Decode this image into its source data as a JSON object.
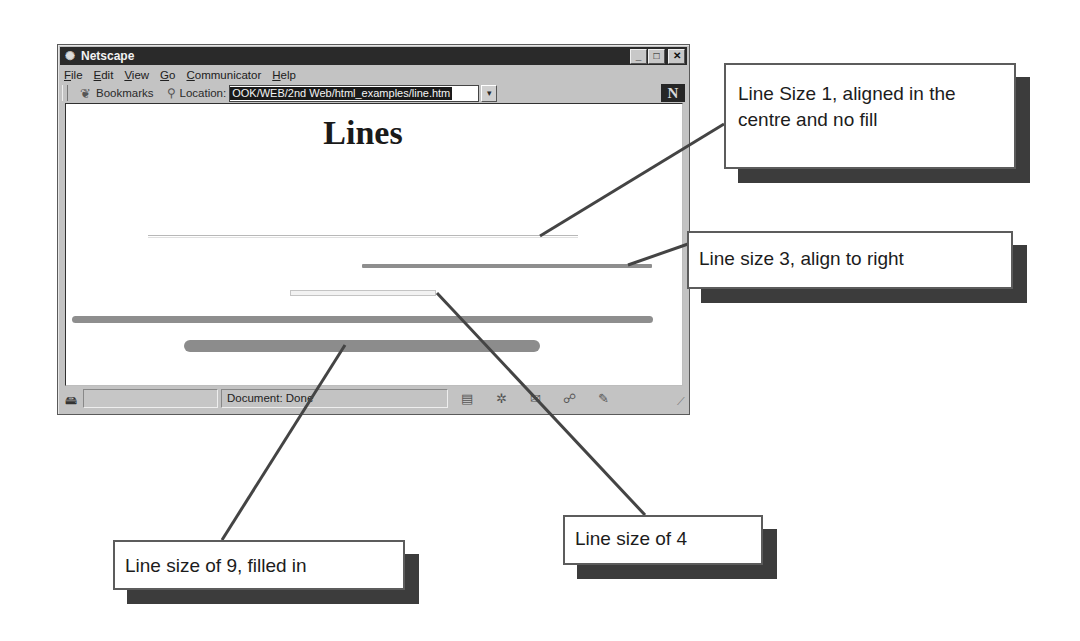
{
  "window": {
    "title": "Netscape",
    "icon": "netscape-icon",
    "controls": [
      "minimize",
      "maximize",
      "close"
    ]
  },
  "menubar": {
    "items": [
      "File",
      "Edit",
      "View",
      "Go",
      "Communicator",
      "Help"
    ]
  },
  "toolbar": {
    "bookmarks_label": "Bookmarks",
    "location_label": "Location:",
    "location_value": "OOK/WEB/2nd Web/html_examples/line.htm",
    "logo": "N"
  },
  "page": {
    "title": "Lines",
    "rules": [
      {
        "size": 1,
        "align": "center",
        "shade": "noshade=false",
        "color": "#bdbdbd"
      },
      {
        "size": 3,
        "align": "right",
        "color": "#8a8a8a"
      },
      {
        "size": 4,
        "align": "center",
        "style": "outlined",
        "color": "#d0d0d0"
      },
      {
        "size": 6,
        "align": "full",
        "color": "#8c8c8c"
      },
      {
        "size": 9,
        "align": "center",
        "style": "filled",
        "color": "#8c8c8c"
      }
    ]
  },
  "statusbar": {
    "text": "Document: Done",
    "icons": [
      "component-icon",
      "security-icon",
      "mail-icon",
      "discussion-icon",
      "composer-icon"
    ]
  },
  "callouts": [
    {
      "text": "Line Size 1, aligned in the centre and no fill"
    },
    {
      "text": "Line size 3, align to right"
    },
    {
      "text": "Line size of 9, filled in"
    },
    {
      "text": "Line size of 4"
    }
  ]
}
